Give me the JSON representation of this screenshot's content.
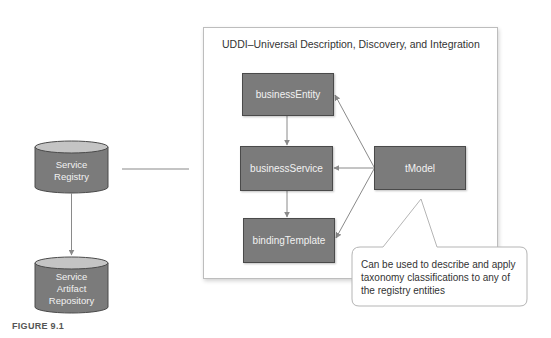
{
  "figure": {
    "label": "FIGURE 9.1"
  },
  "uddi": {
    "title": "UDDI–Universal Description, Discovery, and Integration",
    "nodes": {
      "business_entity": "businessEntity",
      "business_service": "businessService",
      "binding_template": "bindingTemplate",
      "tmodel": "tModel"
    },
    "callout": "Can be used to describe and apply taxonomy classifications to any of the registry entities"
  },
  "left": {
    "service_registry": {
      "line1": "Service",
      "line2": "Registry"
    },
    "artifact_repository": {
      "line1": "Service",
      "line2": "Artifact",
      "line3": "Repository"
    }
  },
  "colors": {
    "node_fill": "#7b7b7b",
    "node_border": "#4a4a4a",
    "arrow": "#8a8a8a"
  }
}
